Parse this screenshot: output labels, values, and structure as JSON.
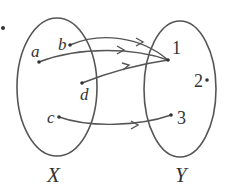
{
  "diagram": {
    "type": "function-mapping",
    "sets": [
      {
        "name": "X",
        "label": "X",
        "elements": [
          "a",
          "b",
          "c",
          "d"
        ]
      },
      {
        "name": "Y",
        "label": "Y",
        "elements": [
          "1",
          "2",
          "3"
        ]
      }
    ],
    "mappings": [
      {
        "from": "a",
        "to": "1"
      },
      {
        "from": "b",
        "to": "1"
      },
      {
        "from": "d",
        "to": "1"
      },
      {
        "from": "c",
        "to": "3"
      }
    ],
    "colors": {
      "stroke": "#555555",
      "text": "#333333",
      "background": "#ffffff"
    }
  },
  "labels": {
    "set_x": "X",
    "set_y": "Y",
    "a": "a",
    "b": "b",
    "c": "c",
    "d": "d",
    "one": "1",
    "two": "2",
    "three": "3"
  }
}
